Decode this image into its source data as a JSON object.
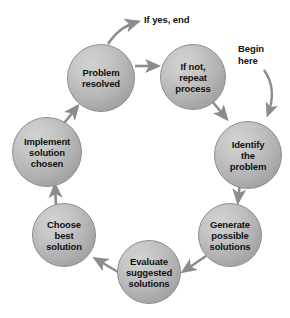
{
  "diagram": {
    "type": "cycle-flowchart",
    "background_color": "#ffffff",
    "node_fill_color": "#b4b4b4",
    "node_border_color": "#8d8d8d",
    "arrow_color": "#8c8c8c",
    "text_color": "#111111",
    "nodes": [
      {
        "id": "problem-resolved",
        "label": "Problem\nresolved",
        "cx": 101,
        "cy": 78,
        "r": 34
      },
      {
        "id": "if-not-repeat-process",
        "label": "If not,\nrepeat\nprocess",
        "cx": 193,
        "cy": 77,
        "r": 33
      },
      {
        "id": "identify-the-problem",
        "label": "Identify\nthe\nproblem",
        "cx": 248,
        "cy": 155,
        "r": 34
      },
      {
        "id": "generate-possible-solutions",
        "label": "Generate\npossible\nsolutions",
        "cx": 230,
        "cy": 235,
        "r": 32
      },
      {
        "id": "evaluate-suggested-solutions",
        "label": "Evaluate\nsuggested\nsolutions",
        "cx": 149,
        "cy": 272,
        "r": 32
      },
      {
        "id": "choose-best-solution",
        "label": "Choose\nbest\nsolution",
        "cx": 64,
        "cy": 235,
        "r": 32
      },
      {
        "id": "implement-solution-chosen",
        "label": "Implement\nsolution\nchosen",
        "cx": 47,
        "cy": 152,
        "r": 35
      }
    ],
    "captions": [
      {
        "id": "if-yes-end",
        "text": "If yes, end",
        "x": 144,
        "y": 14
      },
      {
        "id": "begin-here",
        "text": "Begin\nhere",
        "x": 238,
        "y": 43
      }
    ],
    "connectors": [
      {
        "id": "implement-to-problem-resolved",
        "from": "implement-solution-chosen",
        "to": "problem-resolved"
      },
      {
        "id": "problem-resolved-to-if-yes-end",
        "from": "problem-resolved",
        "to": "if-yes-end"
      },
      {
        "id": "problem-resolved-to-if-not",
        "from": "problem-resolved",
        "to": "if-not-repeat-process"
      },
      {
        "id": "if-not-to-identify",
        "from": "if-not-repeat-process",
        "to": "identify-the-problem"
      },
      {
        "id": "begin-here-to-identify",
        "from": "begin-here",
        "to": "identify-the-problem"
      },
      {
        "id": "identify-to-generate",
        "from": "identify-the-problem",
        "to": "generate-possible-solutions"
      },
      {
        "id": "generate-to-evaluate",
        "from": "generate-possible-solutions",
        "to": "evaluate-suggested-solutions"
      },
      {
        "id": "evaluate-to-choose",
        "from": "evaluate-suggested-solutions",
        "to": "choose-best-solution"
      },
      {
        "id": "choose-to-implement",
        "from": "choose-best-solution",
        "to": "implement-solution-chosen"
      }
    ]
  }
}
